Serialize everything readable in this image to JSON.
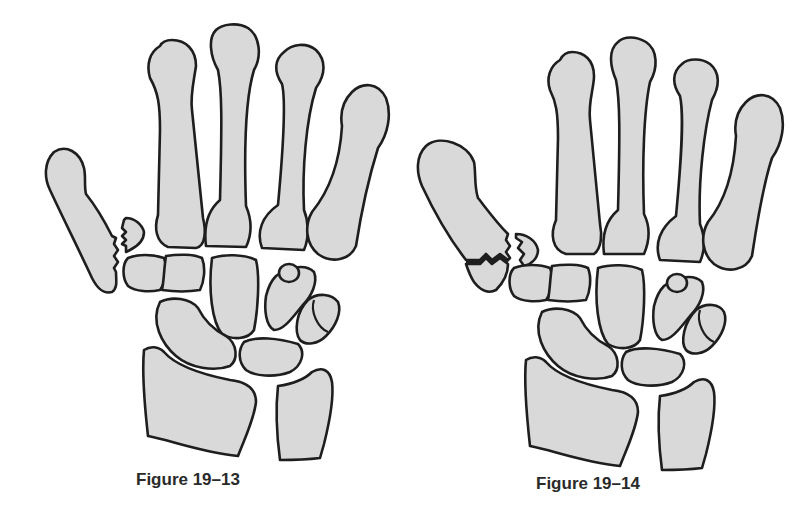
{
  "figures": [
    {
      "id": "figure-19-13",
      "caption": "Figure 19–13",
      "subject": "hand skeleton, fracture at base of first metacarpal (Bennett-type, avulsed fragment)"
    },
    {
      "id": "figure-19-14",
      "caption": "Figure 19–14",
      "subject": "hand skeleton, comminuted fracture at base of first metacarpal (Rolando-type)"
    }
  ],
  "colors": {
    "bone_fill": "#d9d9d9",
    "outline": "#1e1e1e",
    "background": "#ffffff",
    "caption": "#2a2a2a"
  }
}
